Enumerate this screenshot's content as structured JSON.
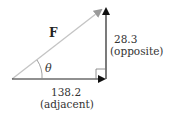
{
  "diagram": {
    "type": "right-triangle-vector-decomposition",
    "vector_label": "F",
    "angle_label": "θ",
    "opposite": {
      "value": "28.3",
      "label": "(opposite)"
    },
    "adjacent": {
      "value": "138.2",
      "label": "(adjacent)"
    },
    "colors": {
      "hypotenuse": "#b8b8b8",
      "legs": "#222222",
      "text": "#333333"
    }
  }
}
